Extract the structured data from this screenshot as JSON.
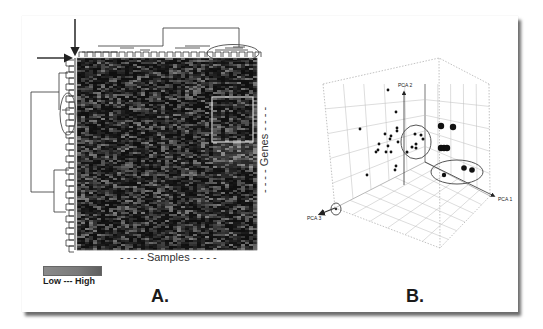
{
  "figure": {
    "panel_a": {
      "label": "A.",
      "x_axis_label": "- - - - Samples - - - -",
      "y_axis_label": "- - - - Genes - - - -",
      "legend": {
        "text": "Low --- High",
        "low_color": "#8a8a8a",
        "high_color": "#5e5e5e"
      },
      "heatmap": {
        "rows": 96,
        "cols": 45,
        "background": "#1a1a1a"
      },
      "annotations": [
        "down-arrow",
        "right-arrow",
        "sample-cluster-ellipse",
        "gene-cluster-ellipse",
        "highlight-box"
      ]
    },
    "panel_b": {
      "label": "B.",
      "axes": {
        "x": "PCA 1",
        "y": "PCA 2",
        "z": "PCA 3"
      },
      "ticks_y": [
        "20",
        "15",
        "10",
        "5",
        "0"
      ],
      "ticks_x": [
        "-10",
        "0",
        "10",
        "20",
        "30"
      ],
      "ticks_z": [
        "-10",
        "0",
        "10",
        "20",
        "30"
      ]
    }
  },
  "chart_data": {
    "type": "scatter",
    "xlabel": "PCA 1",
    "ylabel": "PCA 2",
    "zlabel": "PCA 3",
    "series": [
      {
        "name": "small samples",
        "points_px": [
          [
            360,
            129
          ],
          [
            388,
            90
          ],
          [
            396,
            112
          ],
          [
            397,
            128
          ],
          [
            397,
            131
          ],
          [
            385,
            134
          ],
          [
            391,
            136
          ],
          [
            390,
            139
          ],
          [
            379,
            144
          ],
          [
            398,
            142
          ],
          [
            388,
            146
          ],
          [
            378,
            150
          ],
          [
            376,
            152
          ],
          [
            386,
            152
          ],
          [
            391,
            152
          ],
          [
            396,
            166
          ],
          [
            395,
            170
          ],
          [
            367,
            175
          ]
        ]
      },
      {
        "name": "cluster 1 (circled)",
        "points_px": [
          [
            415,
            134
          ],
          [
            421,
            135
          ],
          [
            423,
            139
          ],
          [
            416,
            144
          ],
          [
            412,
            147
          ],
          [
            416,
            148
          ],
          [
            407,
            152
          ]
        ]
      },
      {
        "name": "large samples",
        "points_px": [
          [
            441,
            126
          ],
          [
            453,
            127
          ],
          [
            441,
            148
          ],
          [
            444,
            148
          ],
          [
            447,
            148
          ]
        ]
      },
      {
        "name": "cluster 2 (circled)",
        "points_px": [
          [
            464,
            168
          ],
          [
            472,
            170
          ],
          [
            444,
            175
          ]
        ]
      }
    ],
    "legend": "none",
    "grid": true
  }
}
